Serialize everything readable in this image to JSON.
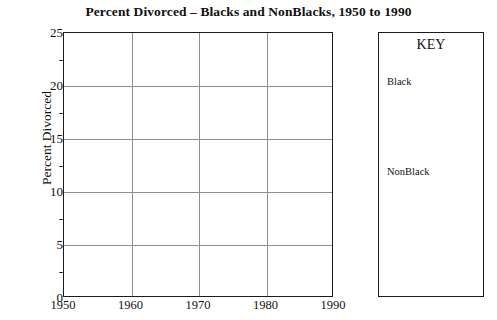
{
  "chart_data": {
    "type": "line",
    "title": "Percent Divorced – Blacks and NonBlacks, 1950 to 1990",
    "xlabel": "",
    "ylabel": "Percent Divorced",
    "xlim": [
      1950,
      1990
    ],
    "ylim": [
      0,
      25
    ],
    "grid": true,
    "x_ticks": [
      1950,
      1960,
      1970,
      1980,
      1990
    ],
    "x_tick_labels": [
      "1950",
      "1960",
      "1970",
      "1980",
      "1990"
    ],
    "y_ticks": [
      0,
      5,
      10,
      15,
      20,
      25
    ],
    "y_tick_labels": [
      "0",
      "5",
      "10",
      "15",
      "20",
      "25"
    ],
    "y_minor_ticks": [
      2.5,
      7.5,
      12.5,
      17.5,
      22.5
    ],
    "y_minor_tick_label": "-",
    "x_gridlines": [
      1960,
      1970,
      1980
    ],
    "y_gridlines": [
      5,
      10,
      15,
      20
    ],
    "legend_position": "right-outside",
    "legend_title": "KEY",
    "series": [
      {
        "name": "Black",
        "x": [],
        "values": []
      },
      {
        "name": "NonBlack",
        "x": [],
        "values": []
      }
    ],
    "plot_note": "Plot area is empty – no data curves drawn"
  },
  "key_panel": {
    "title": "KEY",
    "entries": [
      {
        "label": "Black"
      },
      {
        "label": "NonBlack"
      }
    ]
  },
  "axes": {
    "y_axis_title": "Percent Divorced"
  }
}
